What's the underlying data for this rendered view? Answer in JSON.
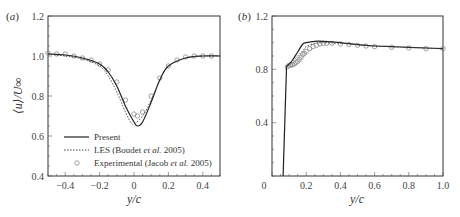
{
  "chart_data": [
    {
      "type": "line",
      "panel_label": "(a)",
      "title": "",
      "xlabel": "y/c",
      "ylabel": "⟨u⟩/U∞",
      "xlim": [
        -0.5,
        0.5
      ],
      "ylim": [
        0.4,
        1.2
      ],
      "x_ticks": [
        "-0.4",
        "-0.2",
        "0",
        "0.2",
        "0.4"
      ],
      "y_ticks": [
        "0.4",
        "0.6",
        "0.8",
        "1.0",
        "1.2"
      ],
      "grid": false,
      "legend_position": "lower center",
      "series": [
        {
          "name": "Present",
          "style": "solid",
          "x": [
            -0.5,
            -0.4,
            -0.3,
            -0.2,
            -0.15,
            -0.1,
            -0.05,
            0.0,
            0.02,
            0.05,
            0.1,
            0.15,
            0.2,
            0.3,
            0.4,
            0.5
          ],
          "y": [
            1.01,
            1.005,
            0.99,
            0.96,
            0.92,
            0.85,
            0.75,
            0.67,
            0.65,
            0.67,
            0.77,
            0.88,
            0.95,
            0.99,
            1.0,
            1.0
          ]
        },
        {
          "name": "LES (Boudet et al. 2005)",
          "style": "dotted",
          "x": [
            -0.5,
            -0.4,
            -0.3,
            -0.2,
            -0.15,
            -0.1,
            -0.05,
            -0.02,
            0.0,
            0.05,
            0.1,
            0.15,
            0.2,
            0.3,
            0.4,
            0.5
          ],
          "y": [
            1.01,
            1.0,
            0.985,
            0.95,
            0.9,
            0.82,
            0.72,
            0.67,
            0.66,
            0.7,
            0.78,
            0.88,
            0.95,
            0.99,
            1.0,
            1.0
          ]
        },
        {
          "name": "Experimental (Jacob et al. 2005)",
          "style": "markers",
          "x": [
            -0.5,
            -0.45,
            -0.4,
            -0.35,
            -0.3,
            -0.25,
            -0.2,
            -0.15,
            -0.1,
            -0.05,
            0.0,
            0.02,
            0.05,
            0.1,
            0.15,
            0.2,
            0.25,
            0.3,
            0.35,
            0.4,
            0.45
          ],
          "y": [
            1.015,
            1.01,
            1.01,
            1.0,
            0.99,
            0.98,
            0.96,
            0.93,
            0.87,
            0.78,
            0.71,
            0.7,
            0.72,
            0.8,
            0.89,
            0.95,
            0.98,
            0.995,
            1.0,
            1.0,
            1.0
          ]
        }
      ]
    },
    {
      "type": "line",
      "panel_label": "(b)",
      "title": "",
      "xlabel": "y/c",
      "ylabel": "",
      "xlim": [
        0,
        1.0
      ],
      "ylim": [
        0,
        1.2
      ],
      "x_ticks": [
        "0",
        "0.2",
        "0.4",
        "0.6",
        "0.8",
        "1.0"
      ],
      "y_ticks": [
        "0.4",
        "0.8",
        "1.2"
      ],
      "grid": false,
      "series": [
        {
          "name": "Present",
          "style": "solid",
          "x": [
            0.065,
            0.085,
            0.1,
            0.12,
            0.15,
            0.18,
            0.2,
            0.25,
            0.3,
            0.4,
            0.5,
            0.6,
            0.7,
            0.8,
            0.9,
            1.0
          ],
          "y": [
            0.0,
            0.82,
            0.84,
            0.87,
            0.93,
            0.99,
            1.0,
            1.01,
            1.01,
            1.0,
            0.985,
            0.975,
            0.97,
            0.965,
            0.96,
            0.955
          ]
        },
        {
          "name": "LES (Boudet et al. 2005)",
          "style": "dotted",
          "x": [
            0.085,
            0.1,
            0.12,
            0.15,
            0.18,
            0.2,
            0.25,
            0.3,
            0.4,
            0.5,
            0.6,
            0.8,
            1.0
          ],
          "y": [
            0.82,
            0.84,
            0.86,
            0.9,
            0.94,
            0.97,
            0.995,
            1.0,
            0.995,
            0.985,
            0.975,
            0.965,
            0.955
          ]
        },
        {
          "name": "Experimental (Jacob et al. 2005)",
          "style": "markers",
          "x": [
            0.09,
            0.1,
            0.11,
            0.12,
            0.13,
            0.14,
            0.15,
            0.16,
            0.17,
            0.18,
            0.19,
            0.2,
            0.22,
            0.24,
            0.26,
            0.28,
            0.3,
            0.32,
            0.35,
            0.4,
            0.45,
            0.5,
            0.55,
            0.6,
            0.7,
            0.8,
            0.9,
            1.0
          ],
          "y": [
            0.82,
            0.83,
            0.83,
            0.835,
            0.84,
            0.85,
            0.86,
            0.875,
            0.89,
            0.91,
            0.92,
            0.935,
            0.955,
            0.97,
            0.98,
            0.99,
            0.995,
            0.995,
            0.995,
            0.99,
            0.985,
            0.98,
            0.975,
            0.97,
            0.965,
            0.96,
            0.955,
            0.955
          ]
        }
      ]
    }
  ],
  "figure": {
    "panel_a_label": "(a)",
    "panel_b_label": "(b)",
    "xlabel_a": "y/c",
    "xlabel_b": "y/c",
    "ylabel_a": "⟨u⟩/U∞",
    "legend": [
      {
        "label": "Present",
        "marker": "solid-line"
      },
      {
        "label": "LES (Boudet et al. 2005)",
        "marker": "dotted-line"
      },
      {
        "label": "Experimental (Jacob et al. 2005)",
        "marker": "circle"
      }
    ]
  }
}
